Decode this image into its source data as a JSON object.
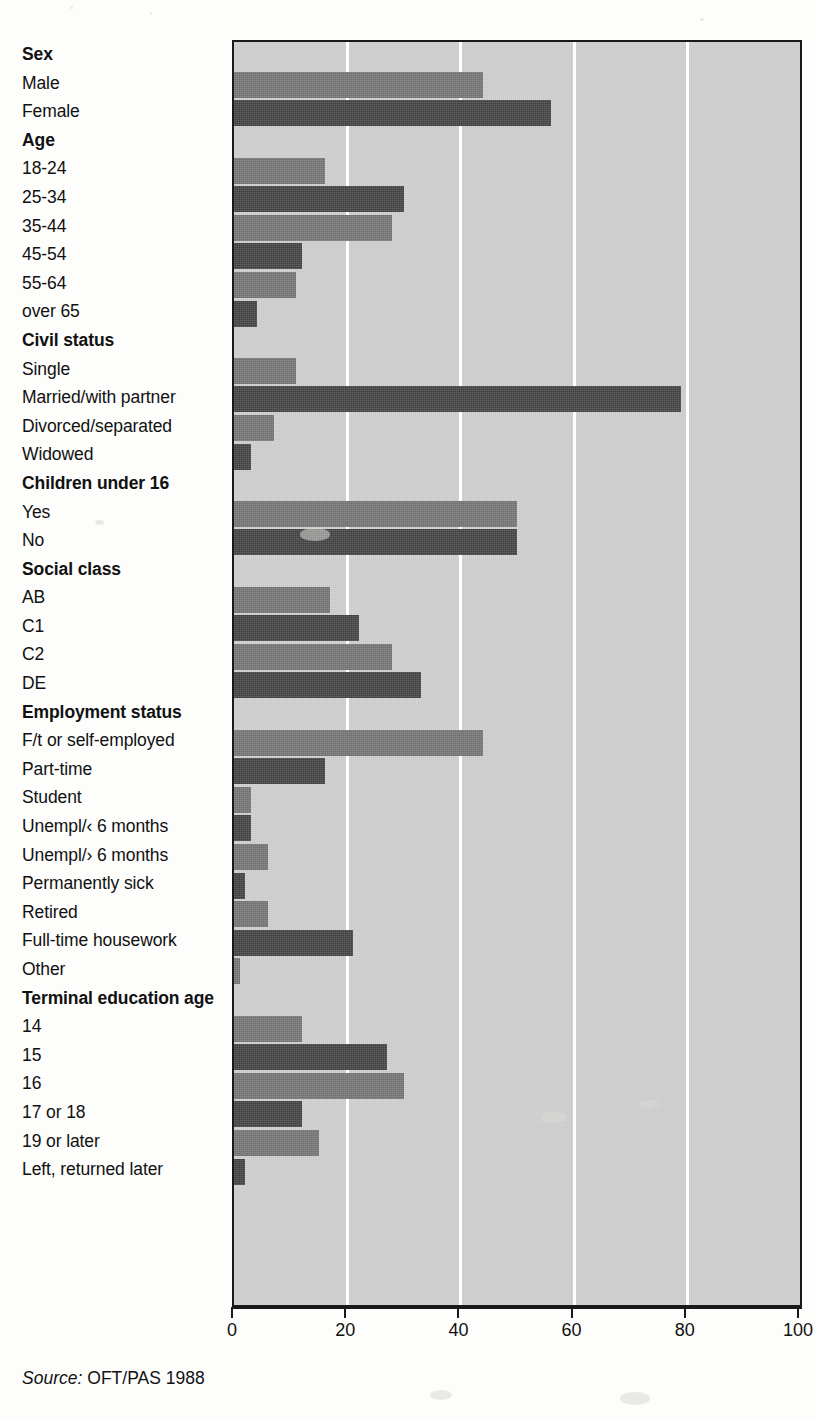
{
  "source": {
    "prefix": "Source:",
    "text": "OFT/PAS 1988"
  },
  "axis": {
    "ticks": [
      "0",
      "20",
      "40",
      "60",
      "80",
      "100"
    ]
  },
  "chart_data": {
    "type": "bar",
    "orientation": "horizontal",
    "title": "",
    "xlabel": "",
    "ylabel": "",
    "xlim": [
      0,
      100
    ],
    "xticks": [
      0,
      20,
      40,
      60,
      80,
      100
    ],
    "grid": true,
    "legend": "none",
    "source": "Source: OFT/PAS 1988",
    "colors": {
      "bar_light": "#6d6d6d",
      "bar_dark": "#3b3b3b",
      "plot_background": "#c9c9c9",
      "gridline": "#ffffff",
      "axis": "#1a1a1a"
    },
    "rows": [
      {
        "label": "Sex",
        "type": "group"
      },
      {
        "label": "Male",
        "type": "bar",
        "value": 44,
        "shade": "light"
      },
      {
        "label": "Female",
        "type": "bar",
        "value": 56,
        "shade": "dark"
      },
      {
        "label": "Age",
        "type": "group"
      },
      {
        "label": "18-24",
        "type": "bar",
        "value": 16,
        "shade": "light"
      },
      {
        "label": "25-34",
        "type": "bar",
        "value": 30,
        "shade": "dark"
      },
      {
        "label": "35-44",
        "type": "bar",
        "value": 28,
        "shade": "light"
      },
      {
        "label": "45-54",
        "type": "bar",
        "value": 12,
        "shade": "dark"
      },
      {
        "label": "55-64",
        "type": "bar",
        "value": 11,
        "shade": "light"
      },
      {
        "label": "over 65",
        "type": "bar",
        "value": 4,
        "shade": "dark"
      },
      {
        "label": "Civil status",
        "type": "group"
      },
      {
        "label": "Single",
        "type": "bar",
        "value": 11,
        "shade": "light"
      },
      {
        "label": "Married/with partner",
        "type": "bar",
        "value": 79,
        "shade": "dark"
      },
      {
        "label": "Divorced/separated",
        "type": "bar",
        "value": 7,
        "shade": "light"
      },
      {
        "label": "Widowed",
        "type": "bar",
        "value": 3,
        "shade": "dark"
      },
      {
        "label": "Children under 16",
        "type": "group"
      },
      {
        "label": "Yes",
        "type": "bar",
        "value": 50,
        "shade": "light"
      },
      {
        "label": "No",
        "type": "bar",
        "value": 50,
        "shade": "dark"
      },
      {
        "label": "Social class",
        "type": "group"
      },
      {
        "label": "AB",
        "type": "bar",
        "value": 17,
        "shade": "light"
      },
      {
        "label": "C1",
        "type": "bar",
        "value": 22,
        "shade": "dark"
      },
      {
        "label": "C2",
        "type": "bar",
        "value": 28,
        "shade": "light"
      },
      {
        "label": "DE",
        "type": "bar",
        "value": 33,
        "shade": "dark"
      },
      {
        "label": "Employment status",
        "type": "group"
      },
      {
        "label": "F/t or self-employed",
        "type": "bar",
        "value": 44,
        "shade": "light"
      },
      {
        "label": "Part-time",
        "type": "bar",
        "value": 16,
        "shade": "dark"
      },
      {
        "label": "Student",
        "type": "bar",
        "value": 3,
        "shade": "light"
      },
      {
        "label": "Unempl/‹ 6 months",
        "type": "bar",
        "value": 3,
        "shade": "dark"
      },
      {
        "label": "Unempl/› 6 months",
        "type": "bar",
        "value": 6,
        "shade": "light"
      },
      {
        "label": "Permanently sick",
        "type": "bar",
        "value": 2,
        "shade": "dark"
      },
      {
        "label": "Retired",
        "type": "bar",
        "value": 6,
        "shade": "light"
      },
      {
        "label": "Full-time housework",
        "type": "bar",
        "value": 21,
        "shade": "dark"
      },
      {
        "label": "Other",
        "type": "bar",
        "value": 1,
        "shade": "light"
      },
      {
        "label": "Terminal education age",
        "type": "group"
      },
      {
        "label": "14",
        "type": "bar",
        "value": 12,
        "shade": "light"
      },
      {
        "label": "15",
        "type": "bar",
        "value": 27,
        "shade": "dark"
      },
      {
        "label": "16",
        "type": "bar",
        "value": 30,
        "shade": "light"
      },
      {
        "label": "17 or 18",
        "type": "bar",
        "value": 12,
        "shade": "dark"
      },
      {
        "label": "19 or later",
        "type": "bar",
        "value": 15,
        "shade": "light"
      },
      {
        "label": "Left, returned later",
        "type": "bar",
        "value": 2,
        "shade": "dark"
      }
    ]
  }
}
